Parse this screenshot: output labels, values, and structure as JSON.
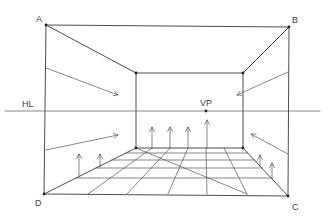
{
  "diagram": {
    "stroke_color": "#3a3a3a",
    "background": "#ffffff",
    "labels": {
      "corner_a": "A",
      "corner_b": "B",
      "corner_c": "C",
      "corner_d": "D",
      "horizon_line": "HL",
      "vanishing_point": "VP"
    },
    "points": {
      "A": [
        46,
        25
      ],
      "B": [
        289,
        27
      ],
      "C": [
        288,
        196
      ],
      "D": [
        44,
        194
      ],
      "back_top_left": [
        136,
        73
      ],
      "back_top_right": [
        243,
        73
      ],
      "back_bottom_left": [
        136,
        148
      ],
      "back_bottom_right": [
        243,
        148
      ],
      "VP": [
        206,
        111
      ]
    },
    "horizon_line": {
      "y": 111,
      "x_start": 5,
      "x_end": 320
    },
    "floor_grid": {
      "front_edge_divisions_x": [
        44,
        88,
        127,
        168,
        207,
        247,
        288
      ],
      "back_edge_divisions_x": [
        136,
        152,
        170,
        188,
        206,
        224,
        243
      ],
      "depth_rows_y": [
        148,
        153,
        160,
        168,
        178,
        194
      ]
    },
    "arrows": {
      "left_wall": [
        {
          "from": [
            46,
            68
          ],
          "to": [
            118,
            95
          ]
        },
        {
          "from": [
            46,
            150
          ],
          "to": [
            118,
            135
          ]
        }
      ],
      "right_wall": [
        {
          "from": [
            288,
            72
          ],
          "to": [
            237,
            95
          ]
        },
        {
          "from": [
            288,
            154
          ],
          "to": [
            251,
            134
          ]
        }
      ],
      "floor_up": [
        {
          "x": 79,
          "y_base": 177,
          "y_tip": 154
        },
        {
          "x": 100,
          "y_base": 167,
          "y_tip": 154
        },
        {
          "x": 152,
          "y_base": 148,
          "y_tip": 127
        },
        {
          "x": 170,
          "y_base": 148,
          "y_tip": 127
        },
        {
          "x": 188,
          "y_base": 148,
          "y_tip": 127
        },
        {
          "x": 207,
          "y_base": 148,
          "y_tip": 120
        },
        {
          "x": 260,
          "y_base": 166,
          "y_tip": 155
        },
        {
          "x": 272,
          "y_base": 178,
          "y_tip": 163
        }
      ]
    }
  }
}
